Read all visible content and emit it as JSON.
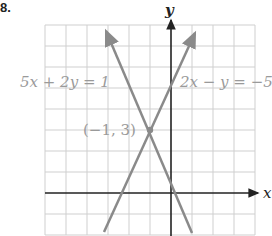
{
  "problem_number": "8.",
  "axes": {
    "x_label": "x",
    "y_label": "y"
  },
  "lines": [
    {
      "label": "5x + 2y = 1",
      "equation": "y = (1 - 5x)/2"
    },
    {
      "label": "2x − y = −5",
      "equation": "y = 2x + 5"
    }
  ],
  "intersection": {
    "label": "(−1, 3)",
    "x": -1,
    "y": 3
  },
  "grid": {
    "x_min": -6,
    "x_max": 4,
    "y_min": -2,
    "y_max": 8,
    "cell_px": 21
  },
  "colors": {
    "grid": "#cfcfcf",
    "axis": "#222222",
    "line": "#8a8a8a",
    "label": "#9a9a9a"
  }
}
